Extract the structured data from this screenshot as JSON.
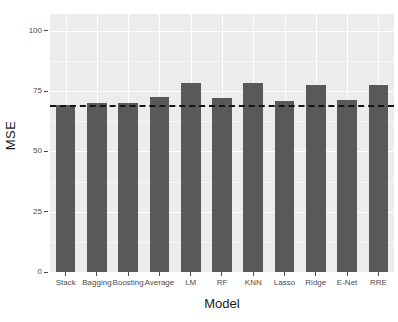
{
  "chart_data": {
    "type": "bar",
    "title": "",
    "subtitle": "",
    "xlabel": "Model",
    "ylabel": "MSE",
    "categories": [
      "Stack",
      "Bagging",
      "Boosting",
      "Average",
      "LM",
      "RF",
      "KNN",
      "Lasso",
      "Ridge",
      "E-Net",
      "RRE"
    ],
    "values": [
      69.2,
      70.2,
      70.2,
      72.5,
      78.5,
      72.0,
      78.5,
      71.0,
      77.5,
      71.5,
      77.5
    ],
    "series": [
      {
        "name": "MSE",
        "values": [
          69.2,
          70.2,
          70.2,
          72.5,
          78.5,
          72.0,
          78.5,
          71.0,
          77.5,
          71.5,
          77.5
        ]
      }
    ],
    "ylim": [
      0,
      107
    ],
    "ytick_values": [
      0,
      25,
      50,
      75,
      100
    ],
    "ytick_labels": [
      "0",
      "25",
      "50",
      "75",
      "100"
    ],
    "yminor_values": [
      12.5,
      37.5,
      62.5,
      87.5
    ],
    "grid": true,
    "legend": null,
    "bar_color": "#595959",
    "panel_background": "#ececec",
    "gridline_color": "#ffffff",
    "annotations": [
      {
        "type": "hline",
        "name": "stack-reference-line",
        "value": 69.2,
        "style": "dashed",
        "color": "#141414"
      }
    ]
  }
}
